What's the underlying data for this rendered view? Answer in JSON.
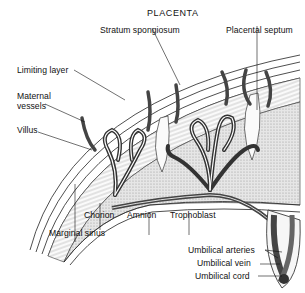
{
  "diagram": {
    "title": "PLACENTA",
    "labels": {
      "stratum_spongiosum": "Stratum spongiosum",
      "placental_septum": "Placental septum",
      "limiting_layer": "Limiting layer",
      "maternal_vessels_1": "Maternal",
      "maternal_vessels_2": "vessels",
      "villus": "Villus",
      "chorion": "Chorion",
      "amnion": "Amnion",
      "trophoblast": "Trophoblast",
      "marginal_sinus": "Marginal sinus",
      "umbilical_arteries": "Umbilical arteries",
      "umbilical_vein": "Umbilical vein",
      "umbilical_cord": "Umbilical cord"
    },
    "colors": {
      "ink": "#111111",
      "vessel_dark": "#555555",
      "stipple": "#bdbdbd",
      "background": "#ffffff"
    }
  }
}
